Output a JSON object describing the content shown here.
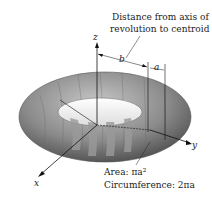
{
  "caption": {
    "line1": "Distance from axis of",
    "line2": "revolution to centroid"
  },
  "axes": {
    "x": "x",
    "y": "y",
    "z": "z"
  },
  "dims": {
    "b": "b",
    "a": "a"
  },
  "formulas": {
    "area": "Area: πa²",
    "circumference": "Circumference: 2πa"
  }
}
